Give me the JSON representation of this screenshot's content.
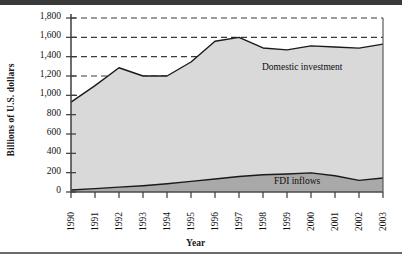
{
  "figure": {
    "background": "#ffffff",
    "top_rule_color": "#3a3a3a",
    "bottom_rule_color": "#6a6a6a"
  },
  "chart_data": {
    "type": "area",
    "stacked": true,
    "title": "",
    "xlabel": "Year",
    "ylabel": "Billions of U.S. dollars",
    "categories": [
      "1990",
      "1991",
      "1992",
      "1993",
      "1994",
      "1995",
      "1996",
      "1997",
      "1998",
      "1999",
      "2000",
      "2001",
      "2002",
      "2003"
    ],
    "x": [
      1990,
      1991,
      1992,
      1993,
      1994,
      1995,
      1996,
      1997,
      1998,
      1999,
      2000,
      2001,
      2002,
      2003
    ],
    "ylim": [
      0,
      1800
    ],
    "xlim": [
      "1990",
      "2003"
    ],
    "ytick_labels": [
      "0",
      "200",
      "400",
      "600",
      "800",
      "1,000",
      "1,200",
      "1,400",
      "1,600",
      "1,800"
    ],
    "ytick_values": [
      0,
      200,
      400,
      600,
      800,
      1000,
      1200,
      1400,
      1600,
      1800
    ],
    "grid": "horizontal-dashed-at-1000-1200-1400-1600-1800",
    "legend_position": "inline-annotations",
    "series": [
      {
        "name": "Domestic investment",
        "fill_color": "#d9d9d9",
        "line_color": "#1a1a1a",
        "values": [
          930,
          1100,
          1285,
          1200,
          1200,
          1345,
          1560,
          1600,
          1490,
          1470,
          1512,
          1500,
          1488,
          1530
        ]
      },
      {
        "name": "FDI inflows",
        "fill_color": "#a9a9a9",
        "line_color": "#1a1a1a",
        "values": [
          20,
          35,
          50,
          65,
          85,
          110,
          135,
          160,
          178,
          186,
          198,
          168,
          120,
          145
        ]
      }
    ],
    "annotations": [
      {
        "text": "Domestic investment",
        "x": 1998,
        "y": 1380
      },
      {
        "text": "FDI inflows",
        "x": 2000,
        "y": 215
      }
    ]
  }
}
